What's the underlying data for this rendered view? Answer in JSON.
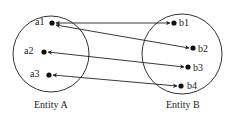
{
  "diagram": {
    "type": "mapping",
    "entities": [
      {
        "id": "A",
        "title": "Entity A",
        "elements": [
          "a1",
          "a2",
          "a3"
        ]
      },
      {
        "id": "B",
        "title": "Entity B",
        "elements": [
          "b1",
          "b2",
          "b3",
          "b4"
        ]
      }
    ],
    "relations": [
      {
        "from": "a1",
        "to": "b1",
        "bidirectional": true
      },
      {
        "from": "a1",
        "to": "b2",
        "bidirectional": true
      },
      {
        "from": "a2",
        "to": "b3",
        "bidirectional": true
      },
      {
        "from": "a3",
        "to": "b4",
        "bidirectional": true
      }
    ],
    "colors": {
      "stroke": "#222222",
      "background": "#ffffff"
    }
  }
}
